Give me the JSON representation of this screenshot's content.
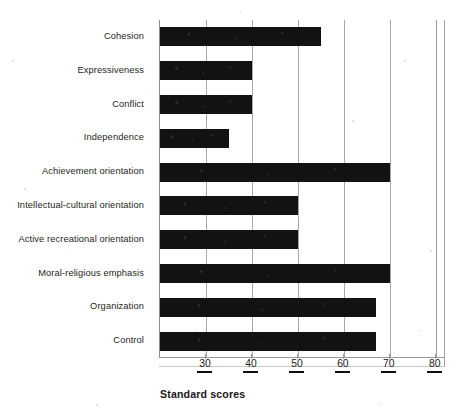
{
  "chart_data": {
    "type": "bar",
    "orientation": "horizontal",
    "title": "",
    "xlabel": "Standard scores",
    "ylabel": "",
    "xlim": [
      20,
      82
    ],
    "xticks": [
      30,
      40,
      50,
      60,
      70,
      80
    ],
    "xtick_labels": [
      "30",
      "40",
      "50",
      "60",
      "70",
      "80"
    ],
    "grid": "vertical",
    "legend": "none",
    "bar_color": "#121212",
    "categories": [
      "Cohesion",
      "Expressiveness",
      "Conflict",
      "Independence",
      "Achievement orientation",
      "Intellectual-cultural orientation",
      "Active recreational orientation",
      "Moral-religious emphasis",
      "Organization",
      "Control"
    ],
    "values": [
      55,
      40,
      40,
      35,
      70,
      50,
      50,
      70,
      67,
      67
    ],
    "series": [
      {
        "name": "Standard scores",
        "values": [
          55,
          40,
          40,
          35,
          70,
          50,
          50,
          70,
          67,
          67
        ]
      }
    ]
  },
  "axis": {
    "title": "Standard scores"
  },
  "colors": {
    "bar": "#121212",
    "grid": "#a8a8a8",
    "text": "#231f20"
  }
}
